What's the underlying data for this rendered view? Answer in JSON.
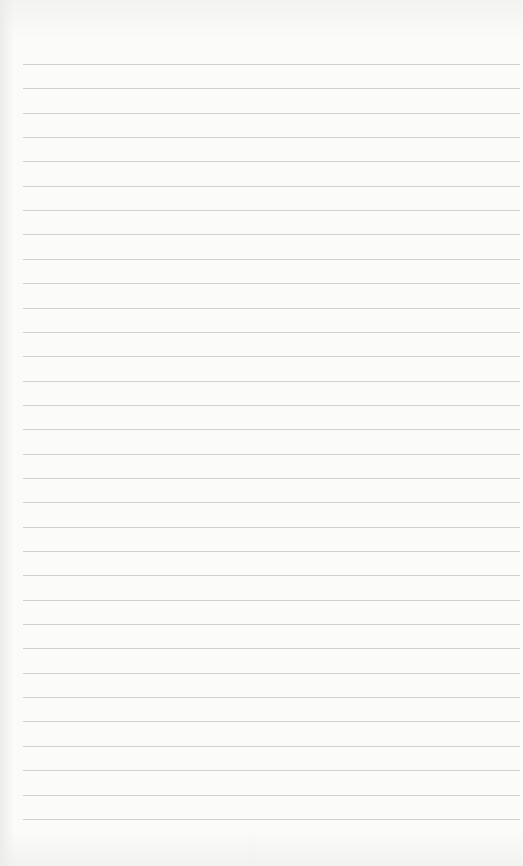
{
  "page": {
    "type": "blank lined paper",
    "background_color": "#fbfbfa",
    "line_color": "#c9c9c9",
    "line_count": 32,
    "first_line_y": 64,
    "line_spacing": 24.35,
    "line_left": 23,
    "line_width": 497
  }
}
